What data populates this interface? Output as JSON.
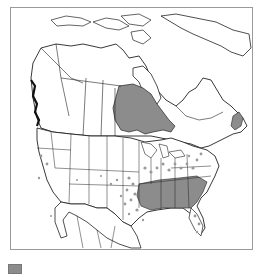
{
  "map": {
    "type": "range-distribution-map",
    "region": "North America",
    "colors": {
      "background": "#ffffff",
      "frame": "#9a9a9a",
      "borders": "#222222",
      "range_fill": "#8c8c8c",
      "county_dots": "#9a9a9a"
    },
    "shaded_regions": [
      "Ontario",
      "Nova Scotia",
      "Georgia",
      "Alabama",
      "Mississippi",
      "South Carolina",
      "North Carolina",
      "Tennessee",
      "Arkansas",
      "Louisiana"
    ],
    "dotted_regions": [
      "Texas",
      "Oklahoma",
      "Missouri",
      "Kentucky",
      "Virginia",
      "Ohio",
      "Indiana",
      "Illinois",
      "Florida",
      "Pennsylvania",
      "Washington",
      "Oregon",
      "California",
      "Kansas"
    ]
  },
  "legend": {
    "items": [
      {
        "swatch_color": "#8c8c8c",
        "label": ""
      }
    ]
  }
}
